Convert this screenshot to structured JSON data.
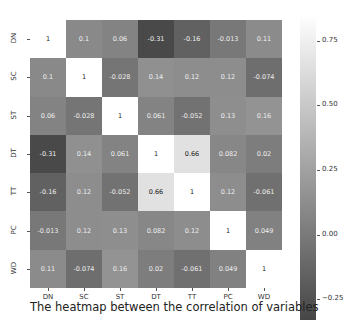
{
  "chart_data": {
    "type": "heatmap",
    "title": "The heatmap between the correlation of variables",
    "xlabel": "",
    "ylabel": "",
    "x_labels": [
      "DN",
      "SC",
      "ST",
      "DT",
      "TT",
      "PC",
      "WD"
    ],
    "y_labels": [
      "DN",
      "SC",
      "ST",
      "DT",
      "TT",
      "PC",
      "WD"
    ],
    "matrix": [
      [
        1,
        0.1,
        0.06,
        -0.31,
        -0.16,
        -0.013,
        0.11
      ],
      [
        0.1,
        1,
        -0.028,
        0.14,
        0.12,
        0.12,
        -0.074
      ],
      [
        0.06,
        -0.028,
        1,
        0.061,
        -0.052,
        0.13,
        0.16
      ],
      [
        -0.31,
        0.14,
        0.061,
        1,
        0.66,
        0.082,
        0.02
      ],
      [
        -0.16,
        0.12,
        -0.052,
        0.66,
        1,
        0.12,
        -0.061
      ],
      [
        -0.013,
        0.12,
        0.13,
        0.082,
        0.12,
        1,
        0.049
      ],
      [
        0.11,
        -0.074,
        0.16,
        0.02,
        -0.061,
        0.049,
        1
      ]
    ],
    "labels": [
      [
        "1",
        "0.1",
        "0.06",
        "-0.31",
        "-0.16",
        "-0.013",
        "0.11"
      ],
      [
        "0.1",
        "1",
        "-0.028",
        "0.14",
        "0.12",
        "0.12",
        "-0.074"
      ],
      [
        "0.06",
        "-0.028",
        "1",
        "0.061",
        "-0.052",
        "0.13",
        "0.16"
      ],
      [
        "-0.31",
        "0.14",
        "0.061",
        "1",
        "0.66",
        "0.082",
        "0.02"
      ],
      [
        "-0.16",
        "0.12",
        "-0.052",
        "0.66",
        "1",
        "0.12",
        "-0.061"
      ],
      [
        "-0.013",
        "0.12",
        "0.13",
        "0.082",
        "0.12",
        "1",
        "0.049"
      ],
      [
        "0.11",
        "-0.074",
        "0.16",
        "0.02",
        "-0.061",
        "0.049",
        "1"
      ]
    ],
    "colormap": "greys (dark = low, light = high)",
    "vmin": -0.31,
    "vmax": 1,
    "colorbar": {
      "ticks": [
        0.75,
        0.5,
        0.25,
        0.0,
        -0.25
      ],
      "tick_labels": [
        "0.75",
        "0.50",
        "0.25",
        "0.00",
        "−0.25"
      ],
      "range": [
        -0.33,
        0.85
      ]
    },
    "grid": false,
    "legend_position": "right (colorbar)"
  },
  "colors": {
    "dark": "#4a4a4a",
    "light": "#ffffff",
    "mid": "#9a9a9a",
    "text_on_dark": "#eeeeee",
    "text_on_light": "#222222"
  }
}
